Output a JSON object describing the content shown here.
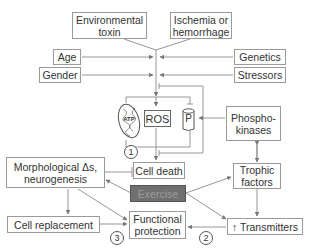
{
  "nodes": {
    "environmental_toxin": [
      "Environmental",
      "toxin"
    ],
    "ischemia": [
      "Ischemia or",
      "hemorrhage"
    ],
    "age": "Age",
    "gender": "Gender",
    "genetics": "Genetics",
    "stressors": "Stressors",
    "atp": "ATP",
    "ros": "ROS",
    "p": "P",
    "phosphokinases": [
      "Phospho-",
      "kinases"
    ],
    "cell_death": "Cell death",
    "exercise": "Exercise",
    "morphological": [
      "Morphological Δs,",
      "neurogenesis"
    ],
    "trophic_factors": [
      "Trophic",
      "factors"
    ],
    "functional_protection": [
      "Functional",
      "protection"
    ],
    "cell_replacement": "Cell replacement",
    "transmitters": "↑ Transmitters"
  },
  "pathway_labels": {
    "one": "1",
    "two": "2",
    "three": "3"
  },
  "colors": {
    "line": "#8a8a8a",
    "box_border": "#9a9a9a",
    "exercise_fill": "#6f6f6f",
    "exercise_text": "#9c9c9c"
  }
}
